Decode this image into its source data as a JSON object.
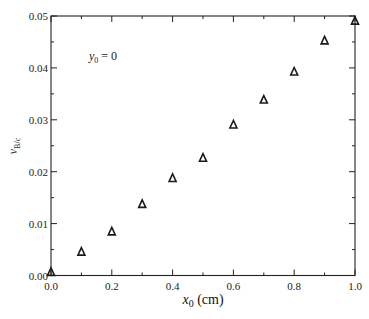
{
  "chart_data": {
    "type": "scatter",
    "title": "",
    "xlabel": "x0 (cm)",
    "xlabel_parts": {
      "var": "x",
      "sub": "0",
      "unit": " (cm)"
    },
    "ylabel": "v_B/c",
    "ylabel_parts": {
      "var": "v",
      "sub": "B/c"
    },
    "xlim": [
      0.0,
      1.0
    ],
    "ylim": [
      0.0,
      0.05
    ],
    "xticks": [
      "0.0",
      "0.2",
      "0.4",
      "0.6",
      "0.8",
      "1.0"
    ],
    "xtick_values": [
      0.0,
      0.2,
      0.4,
      0.6,
      0.8,
      1.0
    ],
    "yticks": [
      "0.00",
      "0.01",
      "0.02",
      "0.03",
      "0.04",
      "0.05"
    ],
    "ytick_values": [
      0.0,
      0.01,
      0.02,
      0.03,
      0.04,
      0.05
    ],
    "grid": false,
    "legend": null,
    "annotations": [
      {
        "text": "y0 = 0",
        "var": "y",
        "sub": "0",
        "rest": " = 0",
        "x": 0.12,
        "y": 0.0423
      }
    ],
    "series": [
      {
        "name": "v_B/c (y0 = 0)",
        "marker": "open-triangle",
        "color": "#1a1a1a",
        "x": [
          0.0,
          0.1,
          0.2,
          0.3,
          0.4,
          0.5,
          0.6,
          0.7,
          0.8,
          0.9,
          1.0
        ],
        "y": [
          0.0007,
          0.0046,
          0.0085,
          0.0138,
          0.0188,
          0.0227,
          0.0291,
          0.0339,
          0.0393,
          0.0453,
          0.0491
        ]
      }
    ]
  },
  "colors": {
    "axis": "#222222",
    "marker": "#1a1a1a",
    "background": "#ffffff"
  }
}
